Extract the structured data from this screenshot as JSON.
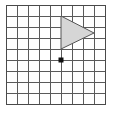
{
  "figure": {
    "canvas": {
      "width": 114,
      "height": 120,
      "background": "#ffffff"
    },
    "grid": {
      "origin_x": 6,
      "origin_y": 5,
      "cell_size": 11,
      "columns": 9,
      "rows": 9,
      "line_color": "#5a5a5a",
      "line_width": 1,
      "border_color": "#4a4a4a",
      "border_width": 1
    },
    "triangle": {
      "label": "shaded-triangle",
      "fill_color": "#d6d6d6",
      "stroke_color": "#555555",
      "stroke_width": 1,
      "orientation": "points-right",
      "vertices_grid": [
        {
          "col": 5,
          "row": 1
        },
        {
          "col": 5,
          "row": 4
        },
        {
          "col": 8,
          "row": 2.5
        }
      ],
      "vertices_px": [
        {
          "x": 61,
          "y": 16
        },
        {
          "x": 61,
          "y": 49
        },
        {
          "x": 94,
          "y": 33
        }
      ]
    },
    "point": {
      "label": "marked-point",
      "color": "#111111",
      "shape": "square-dot",
      "size": 5,
      "grid": {
        "col": 5,
        "row": 5
      },
      "px": {
        "x": 61,
        "y": 60
      }
    }
  }
}
